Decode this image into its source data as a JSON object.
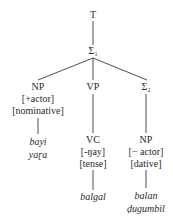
{
  "tree": {
    "root": "T",
    "sigma1": {
      "symbol": "Σ",
      "subscript": "1"
    },
    "np1": {
      "label": "NP",
      "features": [
        "[+actor]",
        "[nominative]"
      ],
      "words": [
        "bayi",
        "yaɽa"
      ]
    },
    "vp": {
      "label": "VP",
      "child": {
        "label": "VC",
        "features": [
          "[-ŋay]",
          "[tense]"
        ],
        "word": "balgal"
      }
    },
    "sigma2": {
      "symbol": "Σ",
      "subscript": "2",
      "child": {
        "label": "NP",
        "features": [
          "[− actor]",
          "[dative]"
        ],
        "words": [
          "balan",
          "ḍugumbil"
        ]
      }
    }
  }
}
